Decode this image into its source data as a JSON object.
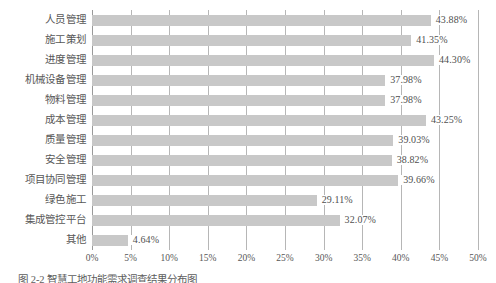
{
  "chart_data": {
    "type": "bar",
    "orientation": "horizontal",
    "title": "",
    "subtitle": "",
    "xlabel": "",
    "ylabel": "",
    "xlim": [
      0,
      50
    ],
    "xtick_labels": [
      "0%",
      "5%",
      "10%",
      "15%",
      "20%",
      "25%",
      "30%",
      "35%",
      "40%",
      "45%",
      "50%"
    ],
    "xticks": [
      0,
      5,
      10,
      15,
      20,
      25,
      30,
      35,
      40,
      45,
      50
    ],
    "grid": "vertical",
    "legend": "none",
    "value_suffix": "%",
    "categories": [
      "人员管理",
      "施工策划",
      "进度管理",
      "机械设备管理",
      "物料管理",
      "成本管理",
      "质量管理",
      "安全管理",
      "项目协同管理",
      "绿色施工",
      "集成管控平台",
      "其他"
    ],
    "values": [
      43.88,
      41.35,
      44.3,
      37.98,
      37.98,
      43.25,
      39.03,
      38.82,
      39.66,
      29.11,
      32.07,
      4.64
    ],
    "data_labels": [
      "43.88%",
      "41.35%",
      "44.30%",
      "37.98%",
      "37.98%",
      "43.25%",
      "39.03%",
      "38.82%",
      "39.66%",
      "29.11%",
      "32.07%",
      "4.64%"
    ],
    "bar_color": "#c8c8c8",
    "gridline_color": "#b6b6b6",
    "axis_color": "#9a9a9a",
    "text_color": "#575757"
  },
  "caption": {
    "text": "图 2-2  智慧工地功能需求调查结果分布图"
  }
}
